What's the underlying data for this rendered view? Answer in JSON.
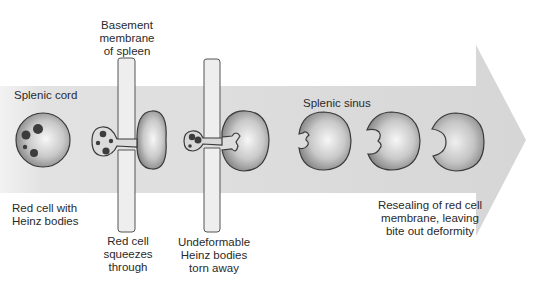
{
  "diagram": {
    "labels": {
      "basement_membrane": "Basement\nmembrane\nof spleen",
      "splenic_cord": "Splenic cord",
      "splenic_sinus": "Splenic sinus",
      "red_cell_heinz": "Red cell with\nHeinz bodies",
      "squeezes": "Red cell\nsqueezes\nthrough",
      "torn_away": "Undeformable\nHeinz bodies\ntorn away",
      "resealing": "Resealing of red cell\nmembrane, leaving\nbite out deformity"
    },
    "stages": [
      {
        "id": "heinz-cell",
        "description": "Red cell with Heinz bodies in splenic cord"
      },
      {
        "id": "squeezing-cell",
        "description": "Red cell squeezes through basement membrane"
      },
      {
        "id": "tearing-cell",
        "description": "Heinz bodies torn away at membrane"
      },
      {
        "id": "bitten-cell-1",
        "description": "Cell with irregular bite in splenic sinus"
      },
      {
        "id": "bitten-cell-2",
        "description": "Bite resealing"
      },
      {
        "id": "bite-cell-final",
        "description": "Resealed bite-out deformity"
      }
    ],
    "colors": {
      "arrow_fill": "#dcdcdc",
      "cell_light": "#f4f4f4",
      "cell_dark": "#8a8a8a",
      "outline": "#3a3a3a",
      "heinz_body": "#3c3c3c",
      "membrane_fill": "#eeeeee"
    }
  }
}
